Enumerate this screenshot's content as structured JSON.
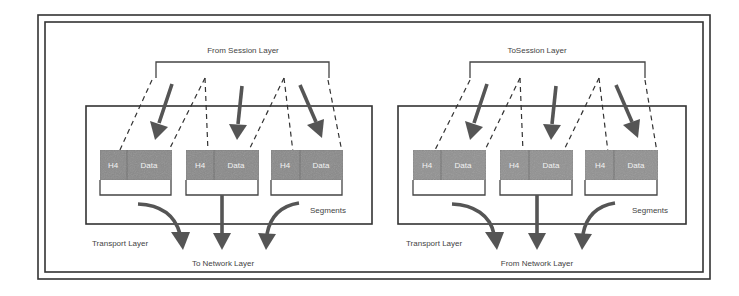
{
  "colors": {
    "frame": "#333333",
    "segment_fill": "#8a8a8a",
    "segment_fill_received": "#929292",
    "arrow": "#555555",
    "text": "#444444"
  },
  "left_panel": {
    "top_label": "From Session Layer",
    "layer_label": "Transport Layer",
    "bottom_label": "To Network Layer",
    "segments_label": "Segments",
    "segments": [
      {
        "header": "H4",
        "data": "Data"
      },
      {
        "header": "H4",
        "data": "Data"
      },
      {
        "header": "H4",
        "data": "Data"
      }
    ]
  },
  "right_panel": {
    "top_label": "ToSession Layer",
    "layer_label": "Transport Layer",
    "bottom_label": "From Network Layer",
    "segments_label": "Segments",
    "segments": [
      {
        "header": "H4",
        "data": "Data"
      },
      {
        "header": "H4",
        "data": "Data"
      },
      {
        "header": "H4",
        "data": "Data"
      }
    ]
  }
}
